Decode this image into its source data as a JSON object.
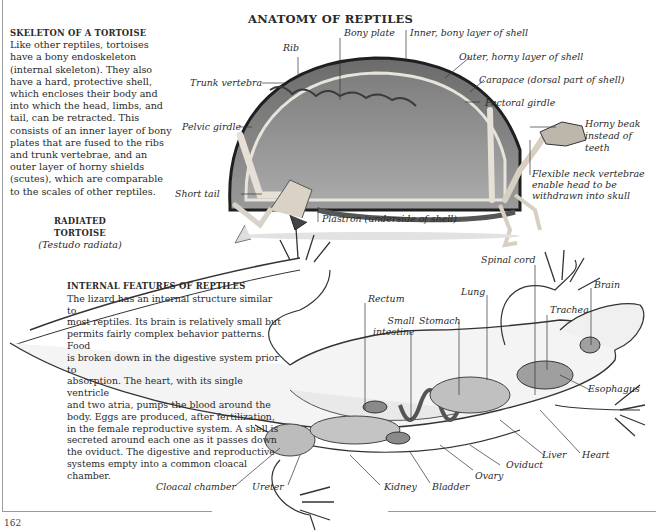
{
  "page": {
    "title": "ANATOMY OF REPTILES",
    "page_number": "162"
  },
  "tortoise_section": {
    "heading": "SKELETON OF A TORTOISE",
    "body_lines": [
      "Like other reptiles, tortoises",
      "have a bony endoskeleton",
      "(internal skeleton). They also",
      "have a hard, protective shell,",
      "which encloses their body and",
      "into which the head, limbs, and",
      "tail, can be retracted. This",
      "consists of an inner layer of bony",
      "plates that are fused to the ribs",
      "and trunk vertebrae, and an",
      "outer layer of horny shields",
      "(scutes), which are comparable",
      "to the scales of other reptiles."
    ],
    "caption_name": "RADIATED TORTOISE",
    "caption_scientific": "(Testudo radiata)",
    "labels": {
      "rib": "Rib",
      "bony_plate": "Bony plate",
      "inner_layer": "Inner, bony layer of shell",
      "outer_layer": "Outer, horny layer of shell",
      "carapace": "Carapace (dorsal part of shell)",
      "pectoral_girdle": "Pectoral  girdle",
      "trunk_vertebra": "Trunk vertebra",
      "pelvic_girdle": "Pelvic girdle",
      "horny_beak_1": "Horny beak",
      "horny_beak_2": "instead of",
      "horny_beak_3": "teeth",
      "neck_1": "Flexible neck vertebrae",
      "neck_2": "enable head to be",
      "neck_3": "withdrawn into skull",
      "short_tail": "Short tail",
      "plastron": "Plastron (underside of shell)"
    }
  },
  "lizard_section": {
    "heading": "INTERNAL FEATURES OF REPTILES",
    "body_lines": [
      "The lizard has an internal structure similar to",
      "most reptiles. Its brain is relatively small but",
      "permits fairly complex behavior patterns. Food",
      "is broken down in the digestive system prior to",
      "absorption. The heart, with its single ventricle",
      "and two atria, pumps the blood around the",
      "body. Eggs are produced, after fertilization,",
      "in the female reproductive system. A shell is",
      "secreted around each one as it passes down",
      "the oviduct. The digestive and reproductive",
      "systems empty into a common cloacal chamber."
    ],
    "labels": {
      "spinal_cord": "Spinal cord",
      "brain": "Brain",
      "lung": "Lung",
      "trachea": "Trachea",
      "rectum": "Rectum",
      "small_intestine_1": "Small",
      "small_intestine_2": "intestine",
      "stomach": "Stomach",
      "esophagus": "Esophagus",
      "liver": "Liver",
      "heart": "Heart",
      "oviduct": "Oviduct",
      "ovary": "Ovary",
      "bladder": "Bladder",
      "kidney": "Kidney",
      "ureter": "Ureter",
      "cloacal_chamber": "Cloacal chamber"
    }
  },
  "colors": {
    "text": "#2a2a2a",
    "frame": "#9a9a9a",
    "shell_dark": "#3a3a3a",
    "shell_mid": "#8a8a8a",
    "bone": "#d8d2c8",
    "organ": "#b8b8b8"
  }
}
